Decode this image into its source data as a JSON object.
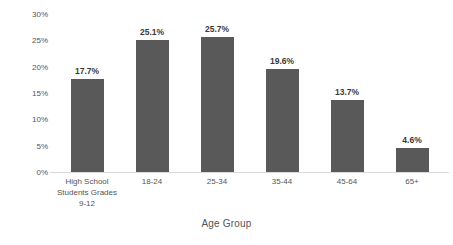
{
  "chart_data": {
    "type": "bar",
    "title": "",
    "xlabel": "Age Group",
    "ylabel": "Percentage",
    "categories": [
      "High School Students Grades 9-12",
      "18-24",
      "25-34",
      "35-44",
      "45-64",
      "65+"
    ],
    "category_lines": [
      [
        "High School",
        "Students Grades",
        "9-12"
      ],
      [
        "18-24"
      ],
      [
        "25-34"
      ],
      [
        "35-44"
      ],
      [
        "45-64"
      ],
      [
        "65+"
      ]
    ],
    "values": [
      17.7,
      25.1,
      25.7,
      19.6,
      13.7,
      4.6
    ],
    "value_labels": [
      "17.7%",
      "25.1%",
      "25.7%",
      "19.6%",
      "13.7%",
      "4.6%"
    ],
    "ylim": [
      0,
      30
    ],
    "ytick_values": [
      0,
      5,
      10,
      15,
      20,
      25,
      30
    ],
    "ytick_labels": [
      "0%",
      "5%",
      "10%",
      "15%",
      "20%",
      "25%",
      "30%"
    ],
    "grid": false,
    "legend": false,
    "legend_position": "none",
    "bar_color": "#595959",
    "axis_color": "#d9d9d9",
    "text_color": "#555555",
    "label_color": "#3a3a3a",
    "background": "#ffffff"
  }
}
